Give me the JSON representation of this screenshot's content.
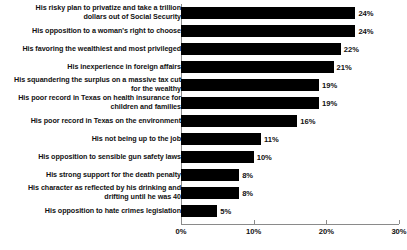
{
  "chart_data": {
    "type": "bar",
    "orientation": "horizontal",
    "title": "",
    "subtitle": "",
    "xlabel": "",
    "ylabel": "",
    "xlim": [
      0,
      30
    ],
    "xticks": [
      "0%",
      "10%",
      "20%",
      "30%"
    ],
    "xtick_values": [
      0,
      10,
      20,
      30
    ],
    "grid": false,
    "legend": false,
    "value_label_suffix": "%",
    "bar_color": "#000000",
    "background_color": "#ffffff",
    "categories": [
      "His risky plan to privatize and take a trillion\ndollars out of Social Security",
      "His opposition to a woman's right to choose",
      "His favoring the wealthiest and most privileged",
      "His inexperience in foreign affairs",
      "His squandering the surplus on a massive tax cut\nfor the wealthy",
      "His poor record in Texas on health insurance for\nchildren and families",
      "His poor record in Texas on the environment",
      "His not being up to the job",
      "His opposition to sensible gun safety laws",
      "His strong support for the death penalty",
      "His character as reflected by his drinking and\ndrifting until he was 40",
      "His opposition to hate crimes legislation"
    ],
    "values": [
      24,
      24,
      22,
      21,
      19,
      19,
      16,
      11,
      10,
      8,
      8,
      5
    ],
    "value_labels": [
      "24%",
      "24%",
      "22%",
      "21%",
      "19%",
      "19%",
      "16%",
      "11%",
      "10%",
      "8%",
      "8%",
      "5%"
    ]
  }
}
